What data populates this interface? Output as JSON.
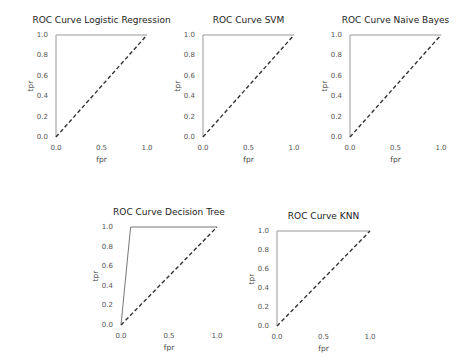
{
  "chart_data": [
    {
      "type": "line",
      "title": "ROC Curve Logistic Regression",
      "xlabel": "fpr",
      "ylabel": "tpr",
      "xlim": [
        0,
        1
      ],
      "ylim": [
        0,
        1
      ],
      "xticks": [
        "0.0",
        "0.5",
        "1.0"
      ],
      "yticks": [
        "0.0",
        "0.2",
        "0.4",
        "0.6",
        "0.8",
        "1.0"
      ],
      "grid": false,
      "series": [
        {
          "name": "roc",
          "style": "solid",
          "color": "#999999",
          "x": [
            0.0,
            0.0,
            1.0
          ],
          "y": [
            0.0,
            1.0,
            1.0
          ]
        },
        {
          "name": "chance",
          "style": "dashed",
          "color": "#333333",
          "x": [
            0.0,
            1.0
          ],
          "y": [
            0.0,
            1.0
          ]
        }
      ]
    },
    {
      "type": "line",
      "title": "ROC Curve SVM",
      "xlabel": "fpr",
      "ylabel": "tpr",
      "xlim": [
        0,
        1
      ],
      "ylim": [
        0,
        1
      ],
      "xticks": [
        "0.0",
        "0.5",
        "1.0"
      ],
      "yticks": [
        "0.0",
        "0.2",
        "0.4",
        "0.6",
        "0.8",
        "1.0"
      ],
      "grid": false,
      "series": [
        {
          "name": "roc",
          "style": "solid",
          "color": "#999999",
          "x": [
            0.0,
            0.0,
            1.0
          ],
          "y": [
            0.0,
            1.0,
            1.0
          ]
        },
        {
          "name": "chance",
          "style": "dashed",
          "color": "#333333",
          "x": [
            0.0,
            1.0
          ],
          "y": [
            0.0,
            1.0
          ]
        }
      ]
    },
    {
      "type": "line",
      "title": "ROC Curve Naive Bayes",
      "xlabel": "fpr",
      "ylabel": "tpr",
      "xlim": [
        0,
        1
      ],
      "ylim": [
        0,
        1
      ],
      "xticks": [
        "0.0",
        "0.5",
        "1.0"
      ],
      "yticks": [
        "0.0",
        "0.2",
        "0.4",
        "0.6",
        "0.8",
        "1.0"
      ],
      "grid": false,
      "series": [
        {
          "name": "roc",
          "style": "solid",
          "color": "#999999",
          "x": [
            0.0,
            0.0,
            1.0
          ],
          "y": [
            0.0,
            1.0,
            1.0
          ]
        },
        {
          "name": "chance",
          "style": "dashed",
          "color": "#333333",
          "x": [
            0.0,
            1.0
          ],
          "y": [
            0.0,
            1.0
          ]
        }
      ]
    },
    {
      "type": "line",
      "title": "ROC Curve Decision Tree",
      "xlabel": "fpr",
      "ylabel": "tpr",
      "xlim": [
        0,
        1
      ],
      "ylim": [
        0,
        1
      ],
      "xticks": [
        "0.0",
        "0.5",
        "1.0"
      ],
      "yticks": [
        "0.0",
        "0.2",
        "0.4",
        "0.6",
        "0.8",
        "1.0"
      ],
      "grid": false,
      "series": [
        {
          "name": "roc",
          "style": "solid",
          "color": "#777777",
          "x": [
            0.0,
            0.1,
            1.0
          ],
          "y": [
            0.0,
            1.0,
            1.0
          ]
        },
        {
          "name": "chance",
          "style": "dashed",
          "color": "#333333",
          "x": [
            0.0,
            1.0
          ],
          "y": [
            0.0,
            1.0
          ]
        }
      ]
    },
    {
      "type": "line",
      "title": "ROC Curve KNN",
      "xlabel": "fpr",
      "ylabel": "tpr",
      "xlim": [
        0,
        1
      ],
      "ylim": [
        0,
        1
      ],
      "xticks": [
        "0.0",
        "0.5",
        "1.0"
      ],
      "yticks": [
        "0.0",
        "0.2",
        "0.4",
        "0.6",
        "0.8",
        "1.0"
      ],
      "grid": false,
      "series": [
        {
          "name": "roc",
          "style": "solid",
          "color": "#999999",
          "x": [
            0.0,
            0.0,
            1.0
          ],
          "y": [
            0.0,
            1.0,
            1.0
          ]
        },
        {
          "name": "chance",
          "style": "dashed",
          "color": "#333333",
          "x": [
            0.0,
            1.0
          ],
          "y": [
            0.0,
            1.0
          ]
        }
      ]
    }
  ]
}
